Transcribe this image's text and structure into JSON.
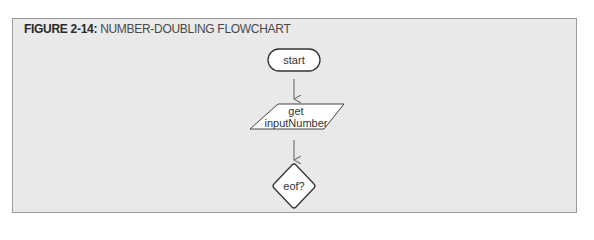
{
  "figure": {
    "number_label": "FIGURE 2-14:",
    "title": "NUMBER-DOUBLING FLOWCHART"
  },
  "flowchart": {
    "nodes": [
      {
        "id": "start",
        "shape": "terminal",
        "label": "start"
      },
      {
        "id": "input",
        "shape": "parallelogram",
        "label_line1": "get",
        "label_line2": "inputNumber"
      },
      {
        "id": "decision",
        "shape": "diamond",
        "label": "eof?"
      }
    ],
    "edges": [
      {
        "from": "start",
        "to": "input"
      },
      {
        "from": "input",
        "to": "decision"
      }
    ]
  },
  "colors": {
    "background": "#e9e9e9",
    "border": "#9a9a9a",
    "node_fill": "#ffffff",
    "node_stroke": "#333333",
    "arrow": "#777777"
  }
}
